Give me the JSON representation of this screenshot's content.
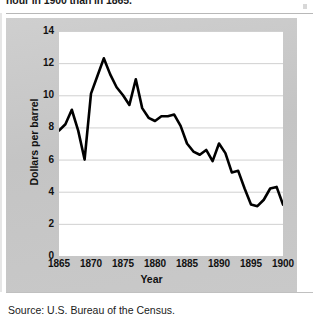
{
  "header": {
    "clipped_text": "hour in 1900 than in 1865."
  },
  "figure": {
    "source_note": "Source: U.S. Bureau of the Census."
  },
  "chart_data": {
    "type": "line",
    "title": "",
    "xlabel": "Year",
    "ylabel": "Dollars per barrel",
    "xlim": [
      1865,
      1900
    ],
    "ylim": [
      0,
      14
    ],
    "xticks": [
      1865,
      1870,
      1875,
      1880,
      1885,
      1890,
      1895,
      1900
    ],
    "yticks": [
      0,
      2,
      4,
      6,
      8,
      10,
      12,
      14
    ],
    "xtick_labels": [
      "1865",
      "1870",
      "1875",
      "1880",
      "1885",
      "1890",
      "1895",
      "1900"
    ],
    "ytick_labels": [
      "0",
      "2",
      "4",
      "6",
      "8",
      "10",
      "12",
      "14"
    ],
    "grid": "horizontal",
    "legend": null,
    "line_color": "#000000",
    "line_width": 2.6,
    "plot_background": "#ffffff",
    "panel_background": "#c9c9c9",
    "x": [
      1865,
      1866,
      1867,
      1868,
      1869,
      1870,
      1871,
      1872,
      1873,
      1874,
      1875,
      1876,
      1877,
      1878,
      1879,
      1880,
      1881,
      1882,
      1883,
      1884,
      1885,
      1886,
      1887,
      1888,
      1889,
      1890,
      1891,
      1892,
      1893,
      1894,
      1895,
      1896,
      1897,
      1898,
      1899,
      1900
    ],
    "values": [
      7.8,
      8.2,
      9.1,
      7.8,
      6.0,
      10.1,
      11.2,
      12.3,
      11.3,
      10.5,
      10.0,
      9.4,
      11.0,
      9.2,
      8.6,
      8.4,
      8.7,
      8.7,
      8.8,
      8.1,
      7.0,
      6.5,
      6.3,
      6.6,
      5.9,
      7.0,
      6.4,
      5.2,
      5.3,
      4.2,
      3.2,
      3.1,
      3.5,
      4.2,
      4.3,
      3.2
    ],
    "series": [
      {
        "name": "Dollars per barrel",
        "values": [
          7.8,
          8.2,
          9.1,
          7.8,
          6.0,
          10.1,
          11.2,
          12.3,
          11.3,
          10.5,
          10.0,
          9.4,
          11.0,
          9.2,
          8.6,
          8.4,
          8.7,
          8.7,
          8.8,
          8.1,
          7.0,
          6.5,
          6.3,
          6.6,
          5.9,
          7.0,
          6.4,
          5.2,
          5.3,
          4.2,
          3.2,
          3.1,
          3.5,
          4.2,
          4.3,
          3.2
        ]
      }
    ]
  }
}
